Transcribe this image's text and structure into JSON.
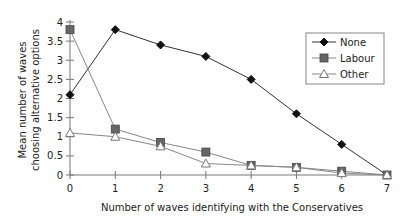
{
  "chart_data": {
    "type": "line",
    "title": "",
    "xlabel": "Number of waves identifying with the Conservatives",
    "ylabel_lines": [
      "Mean number of waves",
      "choosing alternative options"
    ],
    "x": [
      0,
      1,
      2,
      3,
      4,
      5,
      6,
      7
    ],
    "x_ticks": [
      "0",
      "1",
      "2",
      "3",
      "4",
      "5",
      "6",
      "7"
    ],
    "y_ticks": [
      "0",
      "0.5",
      "1",
      "1.5",
      "2",
      "2.5",
      "3",
      "3.5",
      "4"
    ],
    "xlim": [
      0,
      7
    ],
    "ylim": [
      0,
      4
    ],
    "grid": false,
    "legend_position": "upper right",
    "series": [
      {
        "name": "None",
        "marker": "diamond",
        "color": "#111111",
        "values": [
          2.1,
          3.8,
          3.4,
          3.1,
          2.5,
          1.6,
          0.8,
          0.0
        ]
      },
      {
        "name": "Labour",
        "marker": "square",
        "color": "#555555",
        "values": [
          3.8,
          1.2,
          0.85,
          0.6,
          0.25,
          0.2,
          0.1,
          0.0
        ]
      },
      {
        "name": "Other",
        "marker": "triangle",
        "color": "#777777",
        "values": [
          1.1,
          1.0,
          0.75,
          0.3,
          0.25,
          0.2,
          0.05,
          0.0
        ]
      }
    ]
  }
}
